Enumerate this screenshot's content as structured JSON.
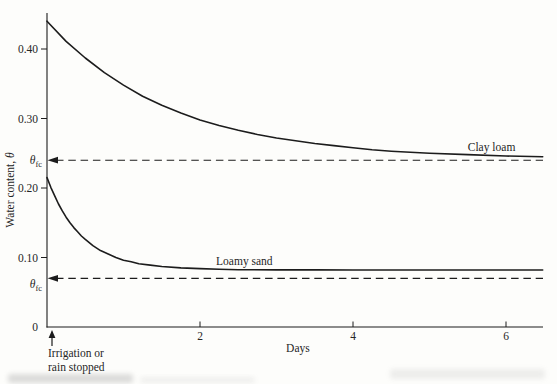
{
  "figure": {
    "background": "#fdfdfb",
    "ink_color": "#1c1c1c",
    "text_color": "#262626"
  },
  "chart_data": {
    "type": "line",
    "title": "",
    "xlabel": "Days",
    "ylabel": "Water content, θ",
    "xlim": [
      0,
      6.5
    ],
    "ylim": [
      0,
      0.45
    ],
    "grid": false,
    "legend_position": "inline-curve-labels",
    "x_ticks": [
      {
        "value": 2,
        "label": "2"
      },
      {
        "value": 4,
        "label": "4"
      },
      {
        "value": 6,
        "label": "6"
      }
    ],
    "y_ticks": [
      {
        "value": 0,
        "label": "0"
      },
      {
        "value": 0.1,
        "label": "0.10"
      },
      {
        "value": 0.2,
        "label": "0.20"
      },
      {
        "value": 0.3,
        "label": "0.30"
      },
      {
        "value": 0.4,
        "label": "0.40"
      }
    ],
    "series": [
      {
        "name": "Clay loam",
        "color": "#1c1c1c",
        "label_at_day": 5.5,
        "field_capacity": 0.24,
        "points": [
          [
            0,
            0.44
          ],
          [
            0.25,
            0.411
          ],
          [
            0.5,
            0.387
          ],
          [
            0.75,
            0.366
          ],
          [
            1,
            0.348
          ],
          [
            1.25,
            0.332
          ],
          [
            1.5,
            0.319
          ],
          [
            1.75,
            0.308
          ],
          [
            2,
            0.298
          ],
          [
            2.25,
            0.29
          ],
          [
            2.5,
            0.283
          ],
          [
            2.75,
            0.277
          ],
          [
            3,
            0.272
          ],
          [
            3.25,
            0.268
          ],
          [
            3.5,
            0.264
          ],
          [
            3.75,
            0.261
          ],
          [
            4,
            0.258
          ],
          [
            4.25,
            0.255
          ],
          [
            4.5,
            0.253
          ],
          [
            5,
            0.25
          ],
          [
            5.5,
            0.248
          ],
          [
            6,
            0.246
          ],
          [
            6.48,
            0.245
          ]
        ]
      },
      {
        "name": "Loamy sand",
        "color": "#1c1c1c",
        "label_at_day": 2.21,
        "field_capacity": 0.07,
        "points": [
          [
            0,
            0.215
          ],
          [
            0.05,
            0.201
          ],
          [
            0.1,
            0.189
          ],
          [
            0.15,
            0.177
          ],
          [
            0.2,
            0.167
          ],
          [
            0.25,
            0.158
          ],
          [
            0.3,
            0.15
          ],
          [
            0.35,
            0.143
          ],
          [
            0.4,
            0.137
          ],
          [
            0.45,
            0.131
          ],
          [
            0.5,
            0.126
          ],
          [
            0.6,
            0.117
          ],
          [
            0.7,
            0.11
          ],
          [
            0.8,
            0.105
          ],
          [
            0.9,
            0.1
          ],
          [
            1,
            0.096
          ],
          [
            1.1,
            0.094
          ],
          [
            1.2,
            0.091
          ],
          [
            1.35,
            0.089
          ],
          [
            1.5,
            0.087
          ],
          [
            1.75,
            0.085
          ],
          [
            2,
            0.084
          ],
          [
            2.25,
            0.083
          ],
          [
            2.5,
            0.0825
          ],
          [
            3,
            0.0822
          ],
          [
            3.5,
            0.0821
          ],
          [
            4,
            0.082
          ],
          [
            4.5,
            0.082
          ],
          [
            5,
            0.082
          ],
          [
            5.5,
            0.082
          ],
          [
            6,
            0.082
          ],
          [
            6.48,
            0.082
          ]
        ]
      }
    ],
    "reference_lines": [
      {
        "series": "Clay loam",
        "value": 0.24,
        "style": "dashed",
        "arrow": "left-at-axis",
        "label_base": "θ",
        "label_sub": "fc",
        "label_position": "on-line"
      },
      {
        "series": "Loamy sand",
        "value": 0.07,
        "style": "dashed",
        "arrow": "left-at-axis",
        "label_base": "θ",
        "label_sub": "fc",
        "label_position": "below-line"
      }
    ],
    "annotation": {
      "lines": [
        "Irrigation or",
        "rain stopped"
      ],
      "at_day": 0,
      "arrow": "up-to-axis"
    }
  }
}
